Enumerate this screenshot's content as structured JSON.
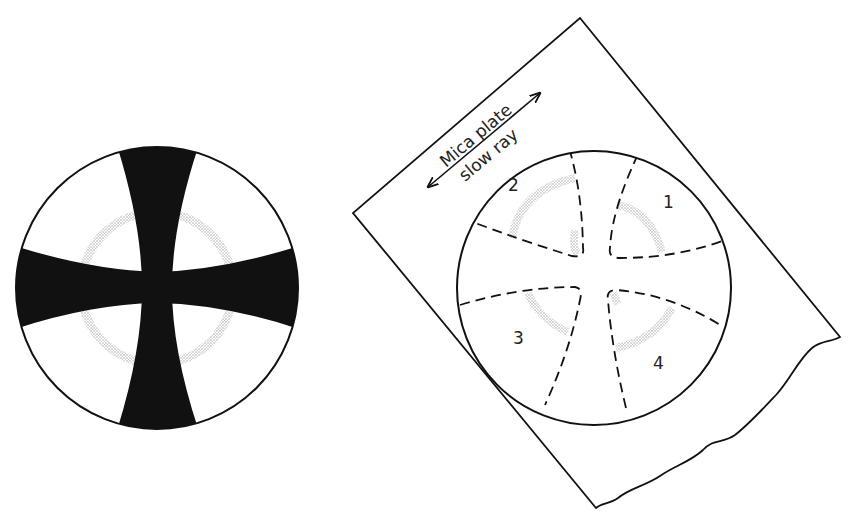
{
  "figure": {
    "left_panel": {
      "description": "Interference figure: black isogyre cross (Maltese cross) with stippled isochrome ring"
    },
    "right_panel": {
      "accessory": {
        "name_line1": "Mica plate",
        "name_line2": "slow ray"
      },
      "quadrants": [
        {
          "label": "1"
        },
        {
          "label": "2"
        },
        {
          "label": "3"
        },
        {
          "label": "4"
        }
      ]
    },
    "colors": {
      "ink": "#111111",
      "stipple": "#b8b8b8",
      "background": "#ffffff"
    }
  }
}
